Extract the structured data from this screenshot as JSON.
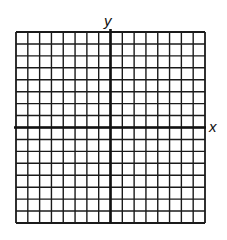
{
  "diagram": {
    "type": "coordinate-grid",
    "x_axis_label": "x",
    "y_axis_label": "y",
    "columns": 16,
    "rows": 16,
    "columns_left_of_y_axis": 8,
    "rows_above_x_axis": 8,
    "grid_color": "#1a1a1a",
    "axis_color": "#111111",
    "background": "#ffffff"
  }
}
